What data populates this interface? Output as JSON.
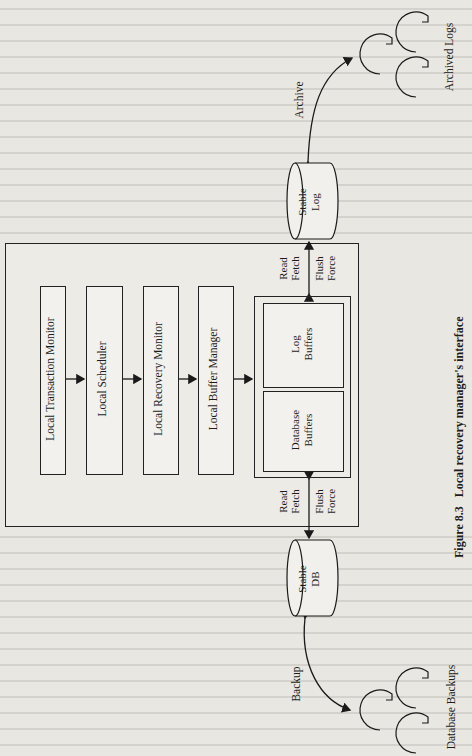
{
  "figure": {
    "caption_number": "Figure 8.3",
    "caption_text": "Local recovery manager's interface"
  },
  "components": {
    "local_transaction_monitor": "Local Transaction Monitor",
    "local_scheduler": "Local Scheduler",
    "local_recovery_monitor": "Local Recovery Monitor",
    "local_buffer_manager": "Local Buffer Manager",
    "log_buffers": "Log Buffers",
    "database_buffers": "Database Buffers"
  },
  "storage": {
    "stable_log": "Stable Log",
    "stable_db": "Stable DB",
    "archived_logs": "Archived Logs",
    "database_backups": "Database Backups"
  },
  "edges": {
    "archive": "Archive",
    "backup": "Backup",
    "log_read": "Read",
    "log_fetch": "Fetch",
    "log_flush": "Flush",
    "log_force": "Force",
    "db_read": "Read",
    "db_fetch": "Fetch",
    "db_flush": "Flush",
    "db_force": "Force"
  }
}
